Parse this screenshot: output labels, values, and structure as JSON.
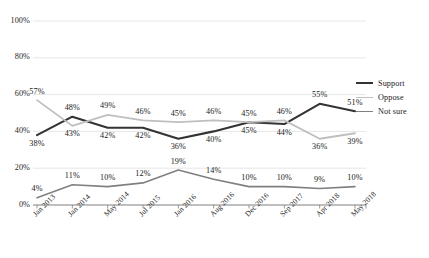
{
  "chart_data": {
    "type": "line",
    "title": "",
    "xlabel": "",
    "ylabel": "",
    "ylim": [
      0,
      100
    ],
    "yticks": [
      "0%",
      "20%",
      "40%",
      "60%",
      "80%",
      "100%"
    ],
    "ytick_values": [
      0,
      20,
      40,
      60,
      80,
      100
    ],
    "grid": true,
    "grid_axis": "y",
    "legend_position": "right",
    "categories": [
      "Jan 2013",
      "Jan 2014",
      "May 2014",
      "Jul 2015",
      "Jan 2016",
      "Aug 2016",
      "Dec 2016",
      "Sep 2017",
      "Apr 2018",
      "May 2018"
    ],
    "series": [
      {
        "name": "Support",
        "color": "#333333",
        "width": 2.1,
        "values": [
          38,
          48,
          42,
          42,
          36,
          40,
          45,
          44,
          55,
          51
        ],
        "labels": [
          "38%",
          "48%",
          "42%",
          "42%",
          "36%",
          "40%",
          "45%",
          "44%",
          "55%",
          "51%"
        ],
        "label_side": [
          "below",
          "above",
          "below",
          "below",
          "below",
          "below",
          "below",
          "below",
          "above",
          "above"
        ]
      },
      {
        "name": "Oppose",
        "color": "#bfbfbf",
        "width": 1.8,
        "values": [
          57,
          43,
          49,
          46,
          45,
          46,
          45,
          46,
          36,
          39
        ],
        "labels": [
          "57%",
          "43%",
          "49%",
          "46%",
          "45%",
          "46%",
          "45%",
          "46%",
          "36%",
          "39%"
        ],
        "label_side": [
          "above",
          "below",
          "above",
          "above",
          "above",
          "above",
          "above",
          "above",
          "below",
          "below"
        ]
      },
      {
        "name": "Not sure",
        "color": "#808080",
        "width": 1.6,
        "values": [
          4,
          11,
          10,
          12,
          19,
          14,
          10,
          10,
          9,
          10
        ],
        "labels": [
          "4%",
          "11%",
          "10%",
          "12%",
          "19%",
          "14%",
          "10%",
          "10%",
          "9%",
          "10%"
        ],
        "label_side": [
          "above",
          "above",
          "above",
          "above",
          "above",
          "above",
          "above",
          "above",
          "above",
          "above"
        ]
      }
    ],
    "legend": [
      {
        "label": "Support",
        "color": "#333333",
        "width": 2.1
      },
      {
        "label": "Oppose",
        "color": "#bfbfbf",
        "width": 1.8
      },
      {
        "label": "Not sure",
        "color": "#808080",
        "width": 1.6
      }
    ],
    "axis_color": "#808080",
    "grid_color": "#e0e0e0"
  }
}
